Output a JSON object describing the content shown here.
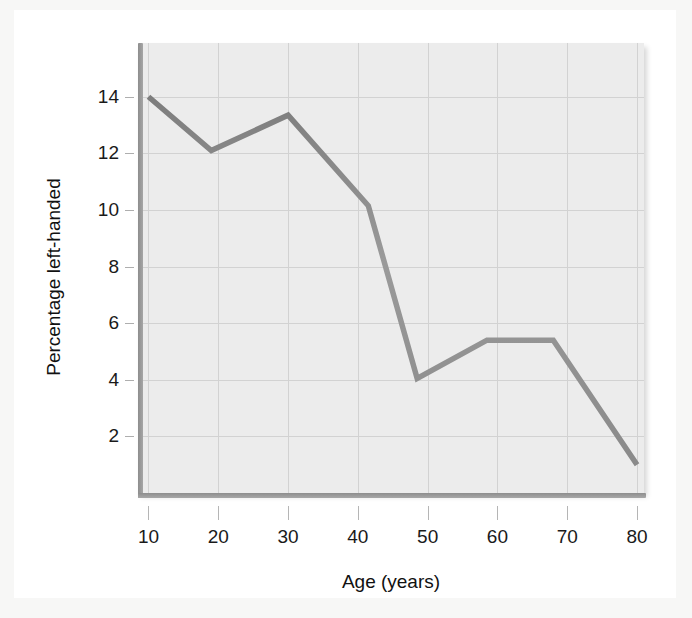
{
  "chart_data": {
    "type": "line",
    "title": "",
    "xlabel": "Age (years)",
    "ylabel": "Percentage left-handed",
    "xlim": [
      8.5,
      81.0
    ],
    "ylim": [
      0.0,
      15.9
    ],
    "grid": true,
    "legend": null,
    "xticks": [
      10,
      20,
      30,
      40,
      50,
      60,
      70,
      80
    ],
    "xtick_labels": [
      "10",
      "20",
      "30",
      "40",
      "50",
      "60",
      "70",
      "80"
    ],
    "yticks": [
      2,
      4,
      6,
      8,
      10,
      12,
      14
    ],
    "ytick_labels": [
      "2",
      "4",
      "6",
      "8",
      "10",
      "12",
      "14"
    ],
    "series": [
      {
        "name": "Percentage left-handed",
        "color": "#8f8f8f",
        "x": [
          10.0,
          19.0,
          30.0,
          41.5,
          48.5,
          58.5,
          68.0,
          80.0
        ],
        "values": [
          14.0,
          12.1,
          13.35,
          10.15,
          4.05,
          5.4,
          5.4,
          1.0
        ]
      }
    ],
    "annotations": []
  },
  "axes": {
    "x_title": "Age (years)",
    "y_title": "Percentage left-handed"
  },
  "style": {
    "plot_background": "#ececec",
    "page_background": "#ffffff",
    "figure_background": "#f7f7f6",
    "grid_color": "#d2d2d2",
    "spine_color": "#8d8d8d",
    "line_color": "#8f8f8f",
    "tick_text_color": "#1a1a1a"
  }
}
